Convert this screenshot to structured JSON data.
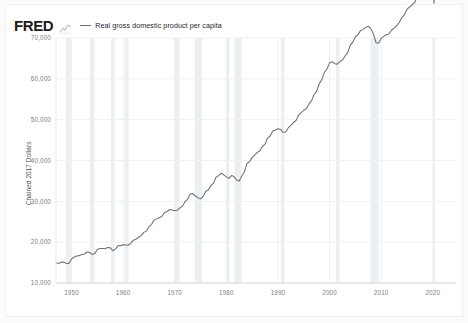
{
  "header": {
    "logo_text": "FRED",
    "logo_mark_name": "fred-line-mark-icon"
  },
  "legend": {
    "series_label": "Real gross domestic product per capita",
    "line_color": "#6b6f76"
  },
  "chart_data": {
    "type": "line",
    "title": "",
    "subtitle": "",
    "xlabel": "",
    "ylabel": "Chained 2017 Dollars",
    "xlim": [
      1947,
      2024.5
    ],
    "ylim": [
      10000,
      70000
    ],
    "grid": true,
    "legend_position": "top-left",
    "xticks": [
      1950,
      1960,
      1970,
      1980,
      1990,
      2000,
      2010,
      2020
    ],
    "xtick_labels": [
      "1950",
      "1960",
      "1970",
      "1980",
      "1990",
      "2000",
      "2010",
      "2020"
    ],
    "yticks": [
      10000,
      20000,
      30000,
      40000,
      50000,
      60000,
      70000
    ],
    "ytick_labels": [
      "10,000",
      "20,000",
      "30,000",
      "40,000",
      "50,000",
      "60,000",
      "70,000"
    ],
    "series": [
      {
        "name": "Real gross domestic product per capita",
        "color": "#6b6f76",
        "units": "Chained 2017 Dollars",
        "x": [
          1947.0,
          1947.5,
          1948.0,
          1948.5,
          1949.0,
          1949.5,
          1950.0,
          1950.5,
          1951.0,
          1951.5,
          1952.0,
          1952.5,
          1953.0,
          1953.5,
          1954.0,
          1954.5,
          1955.0,
          1955.5,
          1956.0,
          1956.5,
          1957.0,
          1957.5,
          1958.0,
          1958.5,
          1959.0,
          1959.5,
          1960.0,
          1960.5,
          1961.0,
          1961.5,
          1962.0,
          1962.5,
          1963.0,
          1963.5,
          1964.0,
          1964.5,
          1965.0,
          1965.5,
          1966.0,
          1966.5,
          1967.0,
          1967.5,
          1968.0,
          1968.5,
          1969.0,
          1969.5,
          1970.0,
          1970.5,
          1971.0,
          1971.5,
          1972.0,
          1972.5,
          1973.0,
          1973.5,
          1974.0,
          1974.5,
          1975.0,
          1975.5,
          1976.0,
          1976.5,
          1977.0,
          1977.5,
          1978.0,
          1978.5,
          1979.0,
          1979.5,
          1980.0,
          1980.5,
          1981.0,
          1981.5,
          1982.0,
          1982.5,
          1983.0,
          1983.5,
          1984.0,
          1984.5,
          1985.0,
          1985.5,
          1986.0,
          1986.5,
          1987.0,
          1987.5,
          1988.0,
          1988.5,
          1989.0,
          1989.5,
          1990.0,
          1990.5,
          1991.0,
          1991.5,
          1992.0,
          1992.5,
          1993.0,
          1993.5,
          1994.0,
          1994.5,
          1995.0,
          1995.5,
          1996.0,
          1996.5,
          1997.0,
          1997.5,
          1998.0,
          1998.5,
          1999.0,
          1999.5,
          2000.0,
          2000.5,
          2001.0,
          2001.5,
          2002.0,
          2002.5,
          2003.0,
          2003.5,
          2004.0,
          2004.5,
          2005.0,
          2005.5,
          2006.0,
          2006.5,
          2007.0,
          2007.5,
          2008.0,
          2008.5,
          2009.0,
          2009.5,
          2010.0,
          2010.5,
          2011.0,
          2011.5,
          2012.0,
          2012.5,
          2013.0,
          2013.5,
          2014.0,
          2014.5,
          2015.0,
          2015.5,
          2016.0,
          2016.5,
          2017.0,
          2017.5,
          2018.0,
          2018.5,
          2019.0,
          2019.5,
          2020.0,
          2020.25,
          2020.5,
          2020.75,
          2021.0,
          2021.5,
          2022.0,
          2022.5,
          2023.0,
          2023.5,
          2024.0,
          2024.5
        ],
        "y": [
          14900,
          14850,
          15050,
          15150,
          14800,
          14750,
          15900,
          16300,
          16600,
          16700,
          17000,
          17100,
          17600,
          17500,
          17000,
          17200,
          18200,
          18450,
          18450,
          18400,
          18700,
          18650,
          17900,
          18300,
          19100,
          19150,
          19350,
          19300,
          19250,
          19700,
          20500,
          20700,
          21200,
          21600,
          22400,
          22700,
          23800,
          24300,
          25400,
          25700,
          26000,
          26300,
          27200,
          27500,
          28000,
          27900,
          27700,
          27800,
          28400,
          28800,
          29900,
          30500,
          31800,
          31900,
          31300,
          30900,
          30600,
          31200,
          32400,
          32800,
          33900,
          34400,
          35900,
          36300,
          36900,
          36500,
          36000,
          35600,
          36300,
          36100,
          35200,
          35000,
          36200,
          37200,
          39300,
          39700,
          40700,
          41300,
          42000,
          42400,
          43400,
          44000,
          45500,
          46000,
          47200,
          47400,
          47800,
          47600,
          46900,
          47000,
          48000,
          48600,
          49300,
          49800,
          51100,
          51700,
          52300,
          52700,
          53800,
          54600,
          56100,
          57000,
          58800,
          59800,
          61600,
          62400,
          63900,
          64200,
          63700,
          63600,
          64200,
          64600,
          65600,
          66400,
          68200,
          69000,
          70300,
          70800,
          71800,
          72100,
          72600,
          72900,
          72300,
          71000,
          68900,
          68700,
          69900,
          70400,
          70800,
          71000,
          71900,
          72400,
          73000,
          73800,
          75000,
          75700,
          77000,
          77600,
          78100,
          78700,
          80100,
          81200,
          83000,
          83800,
          85200,
          85800,
          85000,
          78500,
          85200,
          86500,
          87800,
          88700,
          88400,
          89000,
          89900,
          90500,
          91500,
          92100
        ]
      }
    ],
    "recession_bands": [
      {
        "start": 1948.92,
        "end": 1949.83
      },
      {
        "start": 1953.58,
        "end": 1954.42
      },
      {
        "start": 1957.67,
        "end": 1958.33
      },
      {
        "start": 1960.33,
        "end": 1961.08
      },
      {
        "start": 1969.92,
        "end": 1970.92
      },
      {
        "start": 1973.92,
        "end": 1975.25
      },
      {
        "start": 1980.08,
        "end": 1980.58
      },
      {
        "start": 1981.58,
        "end": 1982.92
      },
      {
        "start": 1990.58,
        "end": 1991.25
      },
      {
        "start": 2001.25,
        "end": 2001.92
      },
      {
        "start": 2007.92,
        "end": 2009.5
      },
      {
        "start": 2020.08,
        "end": 2020.42
      }
    ],
    "recession_band_color": "#eceff1"
  }
}
